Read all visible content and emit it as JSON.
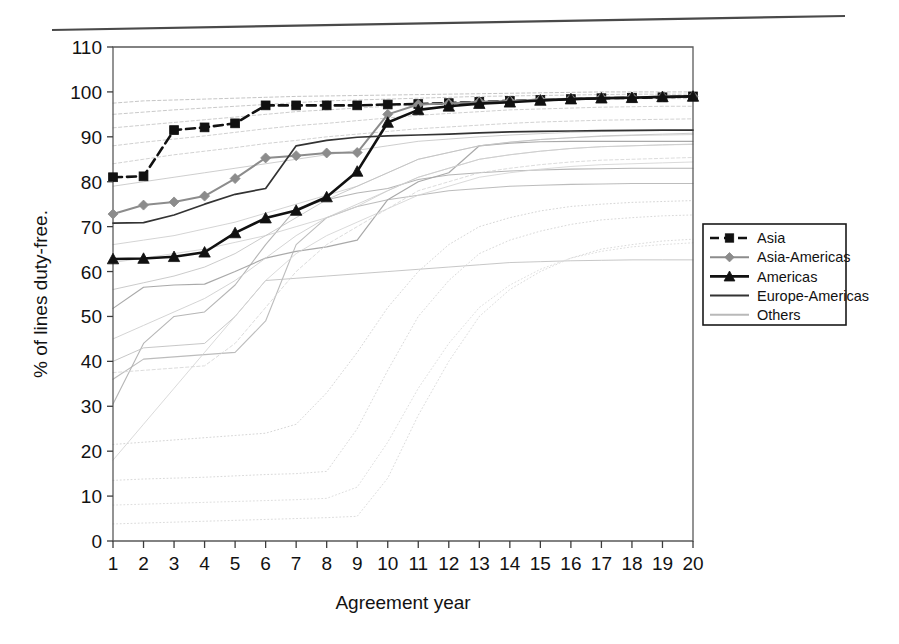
{
  "figure": {
    "background": "#ffffff",
    "top_rule": true
  },
  "chart_data": {
    "type": "line",
    "title": "",
    "xlabel": "Agreement year",
    "ylabel": "% of lines duty-free.",
    "x": [
      1,
      2,
      3,
      4,
      5,
      6,
      7,
      8,
      9,
      10,
      11,
      12,
      13,
      14,
      15,
      16,
      17,
      18,
      19,
      20
    ],
    "xlim": [
      1,
      20
    ],
    "ylim": [
      0,
      110
    ],
    "yticks": [
      0,
      10,
      20,
      30,
      40,
      50,
      60,
      70,
      80,
      90,
      100,
      110
    ],
    "xticks": [
      1,
      2,
      3,
      4,
      5,
      6,
      7,
      8,
      9,
      10,
      11,
      12,
      13,
      14,
      15,
      16,
      17,
      18,
      19,
      20
    ],
    "grid": false,
    "legend_position": "right-outside",
    "series": [
      {
        "name": "Asia",
        "color": "#111111",
        "marker": "square",
        "dash": "dashed",
        "width": 2.6,
        "values": [
          81.0,
          81.2,
          91.5,
          92.1,
          93.0,
          97.0,
          97.0,
          97.0,
          97.0,
          97.2,
          97.3,
          97.5,
          97.8,
          98.0,
          98.2,
          98.4,
          98.6,
          98.7,
          98.8,
          99.0
        ]
      },
      {
        "name": "Asia-Americas",
        "color": "#8c8c8c",
        "marker": "diamond",
        "dash": "solid",
        "width": 2.0,
        "values": [
          72.8,
          74.8,
          75.5,
          76.8,
          80.7,
          85.3,
          85.8,
          86.4,
          86.5,
          95.0,
          97.2,
          97.4,
          97.8,
          98.0,
          98.3,
          98.5,
          98.7,
          98.8,
          98.9,
          99.0
        ]
      },
      {
        "name": "Americas",
        "color": "#111111",
        "marker": "triangle",
        "dash": "solid",
        "width": 2.6,
        "values": [
          62.8,
          62.9,
          63.3,
          64.3,
          68.6,
          71.9,
          73.6,
          76.6,
          82.3,
          93.2,
          96.0,
          96.8,
          97.4,
          97.7,
          98.1,
          98.4,
          98.6,
          98.7,
          98.9,
          99.0
        ]
      },
      {
        "name": "Europe-Americas",
        "color": "#333333",
        "marker": "none",
        "dash": "solid",
        "width": 1.7,
        "values": [
          70.8,
          70.9,
          72.6,
          75.0,
          77.2,
          78.5,
          88.0,
          89.2,
          89.9,
          90.2,
          90.4,
          90.6,
          90.9,
          91.1,
          91.2,
          91.3,
          91.4,
          91.45,
          91.5,
          91.5
        ]
      }
    ],
    "others": {
      "name": "Others",
      "color": "#b9b9b9",
      "count": 46,
      "note": "dense faint background bundle of individual agreement trajectories",
      "lines": [
        {
          "style": "solid",
          "color": "#9a9a9a",
          "width": 1.2,
          "values": [
            51.8,
            56.5,
            57.0,
            57.2,
            60.0,
            63.0,
            64.5,
            65.5,
            67.0,
            76.0,
            80.0,
            82.0,
            88.0,
            88.6,
            88.9,
            89.0,
            89.0,
            89.0,
            89.0,
            89.0
          ]
        },
        {
          "style": "solid",
          "color": "#a8a8a8",
          "width": 1.1,
          "values": [
            30.5,
            44.0,
            50.0,
            51.0,
            57.0,
            66.0,
            74.0,
            76.0,
            77.5,
            78.5,
            80.5,
            81.5,
            82.0,
            82.4,
            82.6,
            82.8,
            82.9,
            83.0,
            83.0,
            83.0
          ]
        },
        {
          "style": "solid",
          "color": "#b0b0b0",
          "width": 1.1,
          "values": [
            36.0,
            40.5,
            41.0,
            41.5,
            42.0,
            49.0,
            66.0,
            72.0,
            74.5,
            76.0,
            77.0,
            78.0,
            78.5,
            79.0,
            79.2,
            79.4,
            79.5,
            79.6,
            79.6,
            79.6
          ]
        },
        {
          "style": "solid",
          "color": "#bdbdbd",
          "width": 1.0,
          "values": [
            40.0,
            43.0,
            43.5,
            44.0,
            50.0,
            58.0,
            58.5,
            59.0,
            59.5,
            60.0,
            60.5,
            61.0,
            61.5,
            62.0,
            62.2,
            62.4,
            62.5,
            62.6,
            62.6,
            62.6
          ]
        },
        {
          "style": "dashed",
          "color": "#bbbbbb",
          "width": 1.0,
          "values": [
            97.5,
            98.0,
            98.2,
            98.4,
            98.6,
            98.8,
            99.0,
            99.1,
            99.2,
            99.3,
            99.4,
            99.5,
            99.6,
            99.7,
            99.8,
            99.9,
            100.0,
            100.0,
            100.0,
            100.0
          ]
        },
        {
          "style": "dashed",
          "color": "#c0c0c0",
          "width": 1.0,
          "values": [
            95.0,
            95.5,
            96.0,
            96.4,
            96.8,
            97.2,
            97.6,
            98.0,
            98.2,
            98.4,
            98.6,
            98.8,
            99.0,
            99.1,
            99.2,
            99.3,
            99.4,
            99.5,
            99.5,
            99.5
          ]
        },
        {
          "style": "dashed",
          "color": "#c4c4c4",
          "width": 1.0,
          "values": [
            92.0,
            92.6,
            93.2,
            93.8,
            94.4,
            95.0,
            95.6,
            96.0,
            96.4,
            96.8,
            97.2,
            97.5,
            97.8,
            98.0,
            98.2,
            98.3,
            98.4,
            98.5,
            98.5,
            98.5
          ]
        },
        {
          "style": "dashed",
          "color": "#c8c8c8",
          "width": 1.0,
          "values": [
            88.0,
            88.8,
            89.5,
            90.2,
            91.0,
            91.8,
            92.5,
            93.0,
            93.6,
            94.2,
            94.8,
            95.2,
            95.6,
            96.0,
            96.2,
            96.4,
            96.6,
            96.7,
            96.8,
            96.8
          ]
        },
        {
          "style": "dashed",
          "color": "#cacaca",
          "width": 1.0,
          "values": [
            84.0,
            85.0,
            86.0,
            86.8,
            87.6,
            88.5,
            89.2,
            90.0,
            90.6,
            91.2,
            91.8,
            92.2,
            92.6,
            93.0,
            93.3,
            93.5,
            93.7,
            93.8,
            93.9,
            94.0
          ]
        },
        {
          "style": "solid",
          "color": "#c6c6c6",
          "width": 1.0,
          "values": [
            79.0,
            80.0,
            81.0,
            82.0,
            83.0,
            84.0,
            85.0,
            86.0,
            87.0,
            88.0,
            89.0,
            89.5,
            90.0,
            90.4,
            90.7,
            91.0,
            91.2,
            91.3,
            91.4,
            91.5
          ]
        },
        {
          "style": "solid",
          "color": "#cccccc",
          "width": 1.0,
          "values": [
            66.0,
            67.0,
            68.0,
            69.5,
            71.0,
            73.0,
            75.0,
            77.0,
            79.0,
            82.0,
            85.0,
            86.5,
            88.0,
            88.8,
            89.4,
            89.8,
            90.1,
            90.3,
            90.4,
            90.5
          ]
        },
        {
          "style": "solid",
          "color": "#d0d0d0",
          "width": 1.0,
          "values": [
            62.0,
            63.0,
            64.0,
            65.0,
            66.5,
            68.0,
            70.0,
            72.0,
            74.5,
            78.0,
            81.0,
            83.0,
            85.0,
            86.0,
            86.8,
            87.4,
            87.8,
            88.0,
            88.2,
            88.3
          ]
        },
        {
          "style": "dotted",
          "color": "#cfcfcf",
          "width": 1.0,
          "values": [
            21.5,
            22.0,
            22.5,
            23.0,
            23.5,
            24.0,
            26.0,
            33.0,
            42.0,
            52.0,
            60.0,
            66.0,
            70.0,
            72.0,
            73.5,
            74.5,
            75.0,
            75.4,
            75.6,
            75.8
          ]
        },
        {
          "style": "dotted",
          "color": "#d2d2d2",
          "width": 1.0,
          "values": [
            13.5,
            13.8,
            14.0,
            14.2,
            14.5,
            14.8,
            15.0,
            15.5,
            25.0,
            38.0,
            50.0,
            58.0,
            64.0,
            67.0,
            69.0,
            70.5,
            71.5,
            72.0,
            72.4,
            72.6
          ]
        },
        {
          "style": "dotted",
          "color": "#d5d5d5",
          "width": 1.0,
          "values": [
            3.8,
            4.0,
            4.2,
            4.4,
            4.6,
            4.8,
            5.0,
            5.2,
            5.5,
            14.0,
            28.0,
            40.0,
            50.0,
            56.0,
            60.0,
            63.0,
            65.0,
            66.0,
            66.8,
            67.2
          ]
        },
        {
          "style": "dotted",
          "color": "#d8d8d8",
          "width": 1.0,
          "values": [
            8.0,
            8.2,
            8.4,
            8.6,
            8.8,
            9.0,
            9.2,
            9.5,
            12.0,
            22.0,
            34.0,
            44.0,
            52.0,
            57.0,
            60.5,
            63.0,
            64.5,
            65.5,
            66.0,
            66.4
          ]
        },
        {
          "style": "solid",
          "color": "#d3d3d3",
          "width": 1.0,
          "values": [
            18.0,
            26.0,
            34.0,
            42.0,
            50.0,
            58.0,
            64.0,
            68.0,
            71.0,
            74.0,
            77.0,
            79.0,
            81.0,
            82.0,
            82.8,
            83.4,
            83.8,
            84.0,
            84.2,
            84.4
          ]
        },
        {
          "style": "solid",
          "color": "#cdcdcd",
          "width": 1.0,
          "values": [
            45.0,
            48.0,
            51.0,
            54.0,
            58.0,
            63.0,
            68.0,
            72.0,
            75.0,
            78.0,
            81.0,
            83.0,
            85.0,
            86.0,
            86.8,
            87.4,
            87.8,
            88.0,
            88.2,
            88.4
          ]
        },
        {
          "style": "dashed",
          "color": "#d6d6d6",
          "width": 1.0,
          "values": [
            37.5,
            38.0,
            38.5,
            39.0,
            44.0,
            52.0,
            60.0,
            66.0,
            70.0,
            74.0,
            78.0,
            80.0,
            82.0,
            83.0,
            83.8,
            84.4,
            84.8,
            85.0,
            85.2,
            85.4
          ]
        },
        {
          "style": "solid",
          "color": "#c2c2c2",
          "width": 1.0,
          "values": [
            56.0,
            57.5,
            59.0,
            61.0,
            64.0,
            68.0,
            72.0,
            76.0,
            79.0,
            82.0,
            85.0,
            86.5,
            88.0,
            88.8,
            89.4,
            89.8,
            90.2,
            90.4,
            90.6,
            90.8
          ]
        }
      ]
    },
    "legend_entries": [
      {
        "label": "Asia",
        "color": "#111111",
        "marker": "square",
        "dash": "dashed"
      },
      {
        "label": "Asia-Americas",
        "color": "#8c8c8c",
        "marker": "diamond",
        "dash": "solid"
      },
      {
        "label": "Americas",
        "color": "#111111",
        "marker": "triangle",
        "dash": "solid"
      },
      {
        "label": "Europe-Americas",
        "color": "#333333",
        "marker": "none",
        "dash": "solid"
      },
      {
        "label": "Others",
        "color": "#b9b9b9",
        "marker": "none",
        "dash": "solid"
      }
    ]
  }
}
